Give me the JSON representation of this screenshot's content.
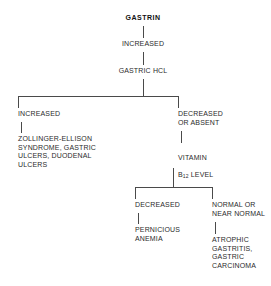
{
  "diagram": {
    "line_color": "#4a4a4a",
    "text_color": "#2b2b2b",
    "background_color": "#ffffff",
    "nodes": {
      "root": "GASTRIN",
      "root_result": "INCREASED",
      "second": "GASTRIC HCL",
      "branch_left": "INCREASED",
      "branch_left_outcome": "ZOLLINGER-ELLISON\nSYNDROME, GASTRIC\nULCERS, DUODENAL\nULCERS",
      "branch_right": "DECREASED\nOR ABSENT",
      "branch_right_test_line1": "VITAMIN",
      "branch_right_test_line2_pre": "B",
      "branch_right_test_line2_sub": "12",
      "branch_right_test_line2_post": " LEVEL",
      "sub_left": "DECREASED",
      "sub_left_outcome": "PERNICIOUS\nANEMIA",
      "sub_right": "NORMAL OR\nNEAR NORMAL",
      "sub_right_outcome": "ATROPHIC\nGASTRITIS,\nGASTRIC\nCARCINOMA"
    }
  }
}
